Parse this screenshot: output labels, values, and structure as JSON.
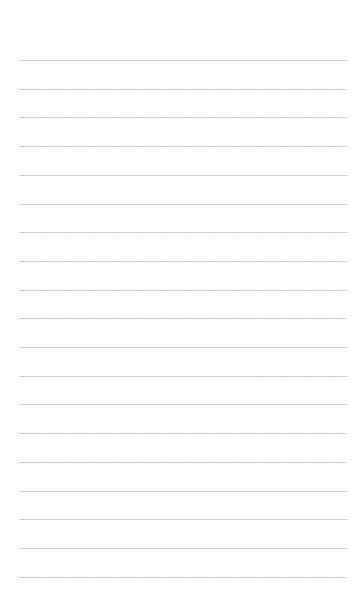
{
  "document": {
    "type": "lined-notebook-page",
    "rule_count": 19,
    "first_rule_y": 60,
    "rule_spacing": 28.7,
    "rule_left": 19,
    "rule_right": 347,
    "rule_color": "#bdbdbd",
    "background": "#ffffff",
    "text_lines": []
  }
}
